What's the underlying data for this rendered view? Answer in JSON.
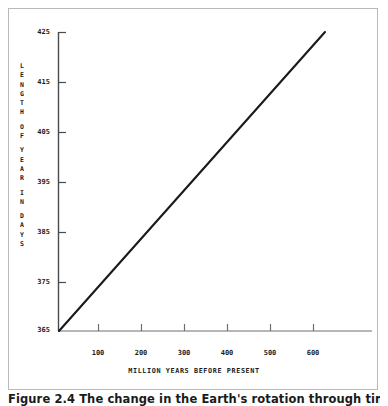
{
  "figure": {
    "caption": "Figure 2.4   The change in the Earth's rotation through time,",
    "frame_color": "#b9b9b9",
    "background": "#ffffff"
  },
  "axis_label_vertical": {
    "full_text": "LENGTH OF YEAR IN DAYS",
    "words": [
      {
        "letters": [
          "L",
          "E",
          "N",
          "G",
          "T",
          "H"
        ]
      },
      {
        "letters": [
          "O",
          "F"
        ]
      },
      {
        "letters": [
          "Y",
          "E",
          "A",
          "R"
        ]
      },
      {
        "letters": [
          "I",
          "N"
        ]
      },
      {
        "letters": [
          "D",
          "A",
          "Y",
          "S"
        ]
      }
    ]
  },
  "chart_data": {
    "type": "line",
    "title": "",
    "subtitle": "",
    "xlabel": "MILLION YEARS BEFORE PRESENT",
    "ylabel": "LENGTH OF YEAR IN DAYS",
    "xlim": [
      0,
      700
    ],
    "ylim": [
      365,
      425
    ],
    "xticks": [
      100,
      200,
      300,
      400,
      500,
      600
    ],
    "xtick_labels": [
      "100",
      "200",
      "300",
      "400",
      "500",
      "600"
    ],
    "yticks": [
      365,
      375,
      385,
      395,
      405,
      415,
      425
    ],
    "ytick_labels": [
      "365",
      "375",
      "385",
      "395",
      "405",
      "415",
      "425"
    ],
    "grid": false,
    "legend": "none",
    "line_color": "#1a1a1a",
    "axis_color": "#4a4a4a",
    "series": [
      {
        "name": "Length of year",
        "x": [
          0,
          100,
          200,
          300,
          400,
          500,
          600
        ],
        "values": [
          365,
          375,
          385,
          395,
          405,
          415,
          425
        ]
      }
    ],
    "annotations": []
  }
}
